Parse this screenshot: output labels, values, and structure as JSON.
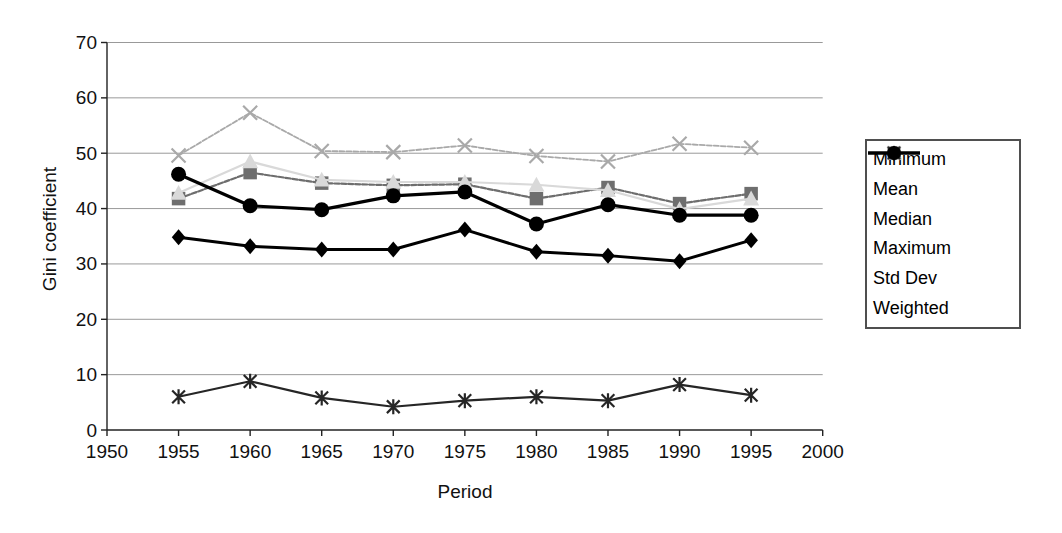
{
  "figure": {
    "background": "#ffffff",
    "grid_color": "#999999",
    "axis_color": "#222222",
    "text_color": "#111111",
    "legend_border_color": "#4f4f4f"
  },
  "chart_data": {
    "type": "line",
    "title": "",
    "xlabel": "Period",
    "ylabel": "Gini coefficient",
    "xlim": [
      1950,
      2000
    ],
    "ylim": [
      0,
      70
    ],
    "x_ticks": [
      1950,
      1955,
      1960,
      1965,
      1970,
      1975,
      1980,
      1985,
      1990,
      1995,
      2000
    ],
    "y_ticks": [
      0,
      10,
      20,
      30,
      40,
      50,
      60,
      70
    ],
    "grid": "horizontal",
    "legend_position": "right",
    "x": [
      1955,
      1960,
      1965,
      1970,
      1975,
      1980,
      1985,
      1990,
      1995
    ],
    "series": [
      {
        "name": "Minimum",
        "marker": "diamond",
        "color": "#000000",
        "line_width": 3,
        "dash": "",
        "values": [
          34.8,
          33.2,
          32.6,
          32.6,
          36.2,
          32.2,
          31.5,
          30.5,
          34.3
        ]
      },
      {
        "name": "Mean",
        "marker": "square",
        "color": "#6e6e6e",
        "line_width": 2.2,
        "dash": "5 2",
        "values": [
          41.8,
          46.5,
          44.6,
          44.2,
          44.4,
          41.8,
          43.8,
          40.9,
          42.7
        ]
      },
      {
        "name": "Median",
        "marker": "triangle",
        "color": "#d9d9d9",
        "line_width": 2.2,
        "dash": "",
        "values": [
          42.8,
          48.5,
          45.2,
          44.8,
          44.8,
          44.3,
          43.3,
          39.9,
          41.8
        ]
      },
      {
        "name": "Maximum",
        "marker": "x",
        "color": "#a9a9a9",
        "line_width": 1.8,
        "dash": "5 2",
        "values": [
          49.6,
          57.3,
          50.4,
          50.2,
          51.4,
          49.5,
          48.5,
          51.7,
          51.0
        ]
      },
      {
        "name": "Std Dev",
        "marker": "asterisk",
        "color": "#262626",
        "line_width": 2.2,
        "dash": "",
        "values": [
          6.0,
          8.8,
          5.8,
          4.2,
          5.3,
          6.0,
          5.3,
          8.2,
          6.3
        ]
      },
      {
        "name": "Weighted",
        "marker": "circle",
        "color": "#000000",
        "line_width": 3.2,
        "dash": "",
        "values": [
          46.2,
          40.5,
          39.8,
          42.3,
          43.0,
          37.2,
          40.7,
          38.8,
          38.8
        ]
      }
    ]
  }
}
